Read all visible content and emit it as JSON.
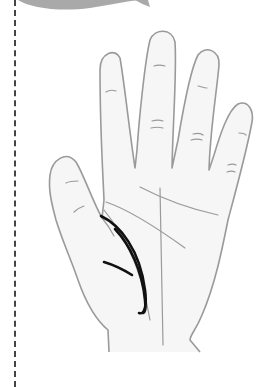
{
  "illustration": {
    "subject": "palm of right hand with highlighted life line",
    "highlighted_line": "life-line",
    "colors": {
      "outline": "#9a9a9a",
      "palm_fill": "#f4f4f4",
      "highlight": "#111111",
      "top_shape": "#a9a9a9",
      "divider": "#444444"
    }
  }
}
